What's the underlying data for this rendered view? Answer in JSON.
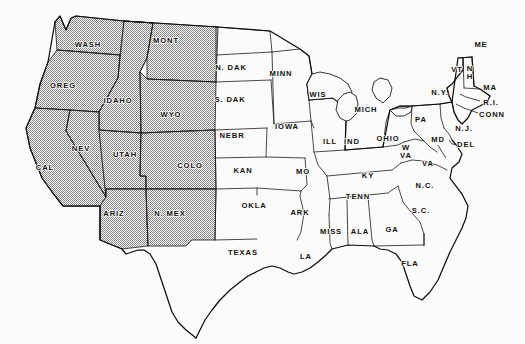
{
  "map": {
    "title": "United States State Map",
    "background_color": "#fbfbfb",
    "line_color": "#1a1a1a",
    "label_color": "#111111",
    "shading": {
      "style": "stipple",
      "description": "fine dotted halftone fill",
      "color": "#6e6e6e",
      "shaded_states": [
        "WASH",
        "OREG",
        "CAL",
        "IDAHO",
        "NEV",
        "UTAH",
        "ARIZ",
        "MONT",
        "WYO",
        "COLO",
        "N. MEX"
      ],
      "shaded_count": 11
    },
    "label_font_size": 7.6,
    "states": [
      {
        "id": "wash",
        "label": "WASH",
        "x": 88,
        "y": 45,
        "shaded": true
      },
      {
        "id": "oreg",
        "label": "OREG",
        "x": 63,
        "y": 86,
        "shaded": true
      },
      {
        "id": "cal",
        "label": "CAL",
        "x": 45,
        "y": 168,
        "shaded": true
      },
      {
        "id": "idaho",
        "label": "IDAHO",
        "x": 118,
        "y": 101,
        "shaded": true
      },
      {
        "id": "nev",
        "label": "NEV",
        "x": 81,
        "y": 149,
        "shaded": true
      },
      {
        "id": "utah",
        "label": "UTAH",
        "x": 125,
        "y": 155,
        "shaded": true
      },
      {
        "id": "ariz",
        "label": "ARIZ",
        "x": 114,
        "y": 214,
        "shaded": true
      },
      {
        "id": "mont",
        "label": "MONT",
        "x": 166,
        "y": 41,
        "shaded": true
      },
      {
        "id": "wyo",
        "label": "WYO",
        "x": 171,
        "y": 115,
        "shaded": true
      },
      {
        "id": "colo",
        "label": "COLO",
        "x": 190,
        "y": 166,
        "shaded": true
      },
      {
        "id": "nmex",
        "label": "N. MEX",
        "x": 170,
        "y": 214,
        "shaded": true
      },
      {
        "id": "ndak",
        "label": "N. DAK",
        "x": 231,
        "y": 68,
        "shaded": false
      },
      {
        "id": "sdak",
        "label": "S. DAK",
        "x": 230,
        "y": 100,
        "shaded": false
      },
      {
        "id": "nebr",
        "label": "NEBR",
        "x": 232,
        "y": 136,
        "shaded": false
      },
      {
        "id": "kan",
        "label": "KAN",
        "x": 243,
        "y": 171,
        "shaded": false
      },
      {
        "id": "okla",
        "label": "OKLA",
        "x": 254,
        "y": 206,
        "shaded": false
      },
      {
        "id": "texas",
        "label": "TEXAS",
        "x": 243,
        "y": 253,
        "shaded": false
      },
      {
        "id": "minn",
        "label": "MINN",
        "x": 281,
        "y": 74,
        "shaded": false
      },
      {
        "id": "iowa",
        "label": "IOWA",
        "x": 287,
        "y": 127,
        "shaded": false
      },
      {
        "id": "mo",
        "label": "MO",
        "x": 303,
        "y": 172,
        "shaded": false
      },
      {
        "id": "ark",
        "label": "ARK",
        "x": 300,
        "y": 213,
        "shaded": false
      },
      {
        "id": "la",
        "label": "LA",
        "x": 306,
        "y": 257,
        "shaded": false
      },
      {
        "id": "wis",
        "label": "WIS",
        "x": 318,
        "y": 95,
        "shaded": false
      },
      {
        "id": "ill",
        "label": "ILL",
        "x": 330,
        "y": 142,
        "shaded": false
      },
      {
        "id": "miss",
        "label": "MISS",
        "x": 331,
        "y": 232,
        "shaded": false
      },
      {
        "id": "mich",
        "label": "MICH",
        "x": 366,
        "y": 110,
        "shaded": false
      },
      {
        "id": "ind",
        "label": "IND",
        "x": 352,
        "y": 142,
        "shaded": false
      },
      {
        "id": "ky",
        "label": "KY",
        "x": 368,
        "y": 176,
        "shaded": false
      },
      {
        "id": "tenn",
        "label": "TENN",
        "x": 358,
        "y": 197,
        "shaded": false
      },
      {
        "id": "ala",
        "label": "ALA",
        "x": 360,
        "y": 232,
        "shaded": false
      },
      {
        "id": "ga",
        "label": "GA",
        "x": 392,
        "y": 230,
        "shaded": false
      },
      {
        "id": "fla",
        "label": "FLA",
        "x": 410,
        "y": 264,
        "shaded": false
      },
      {
        "id": "ohio",
        "label": "OHIO",
        "x": 388,
        "y": 139,
        "shaded": false
      },
      {
        "id": "wva",
        "label": "W\nVA",
        "x": 406,
        "y": 152,
        "shaded": false,
        "multiline": true
      },
      {
        "id": "va",
        "label": "VA",
        "x": 428,
        "y": 164,
        "shaded": false
      },
      {
        "id": "nc",
        "label": "N.C.",
        "x": 425,
        "y": 186,
        "shaded": false
      },
      {
        "id": "sc",
        "label": "S.C.",
        "x": 421,
        "y": 211,
        "shaded": false
      },
      {
        "id": "pa",
        "label": "PA",
        "x": 421,
        "y": 120,
        "shaded": false
      },
      {
        "id": "ny",
        "label": "N.Y.",
        "x": 440,
        "y": 93,
        "shaded": false
      },
      {
        "id": "md",
        "label": "MD",
        "x": 438,
        "y": 140,
        "shaded": false
      },
      {
        "id": "del",
        "label": "DEL",
        "x": 466,
        "y": 145,
        "shaded": false
      },
      {
        "id": "nj",
        "label": "N.J.",
        "x": 464,
        "y": 129,
        "shaded": false
      },
      {
        "id": "me",
        "label": "ME",
        "x": 481,
        "y": 45,
        "shaded": false
      },
      {
        "id": "vt",
        "label": "VT",
        "x": 457,
        "y": 70,
        "shaded": false
      },
      {
        "id": "nh",
        "label": "N\nH",
        "x": 470,
        "y": 73,
        "shaded": false,
        "multiline": true
      },
      {
        "id": "ma",
        "label": "MA",
        "x": 490,
        "y": 88,
        "shaded": false
      },
      {
        "id": "ri",
        "label": "R.I.",
        "x": 491,
        "y": 103,
        "shaded": false
      },
      {
        "id": "conn",
        "label": "CONN",
        "x": 492,
        "y": 115,
        "shaded": false
      }
    ]
  }
}
